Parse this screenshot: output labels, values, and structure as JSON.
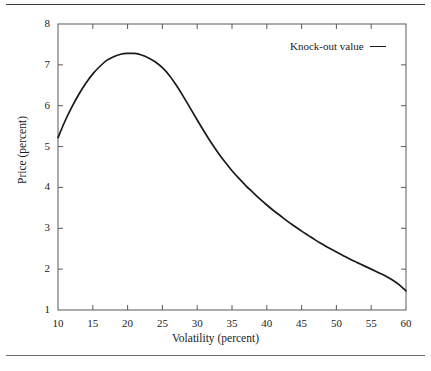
{
  "figure": {
    "top_rule": "horizontal-rule",
    "bottom_rule": "horizontal-rule"
  },
  "chart_data": {
    "type": "line",
    "title": "",
    "xlabel": "Volatility (percent)",
    "ylabel": "Price (percent)",
    "xlim": [
      10,
      60
    ],
    "ylim": [
      1,
      8
    ],
    "xticks": [
      10,
      15,
      20,
      25,
      30,
      35,
      40,
      45,
      50,
      55,
      60
    ],
    "yticks": [
      1,
      2,
      3,
      4,
      5,
      6,
      7,
      8
    ],
    "grid": false,
    "legend_position": "top-right",
    "line_color": "#1a1a1a",
    "series": [
      {
        "name": "Knock-out value",
        "x": [
          10,
          11,
          12,
          13,
          14,
          15,
          16,
          17,
          18,
          19,
          20,
          21,
          22,
          23,
          24,
          25,
          26,
          27,
          28,
          29,
          30,
          31,
          32,
          33,
          34,
          35,
          36,
          37,
          38,
          39,
          40,
          41,
          42,
          43,
          44,
          45,
          46,
          47,
          48,
          49,
          50,
          51,
          52,
          53,
          54,
          55,
          56,
          57,
          58,
          59,
          60
        ],
        "y": [
          5.22,
          5.62,
          5.97,
          6.28,
          6.55,
          6.78,
          6.96,
          7.11,
          7.2,
          7.26,
          7.28,
          7.28,
          7.24,
          7.17,
          7.07,
          6.93,
          6.74,
          6.5,
          6.23,
          5.94,
          5.65,
          5.37,
          5.1,
          4.85,
          4.62,
          4.41,
          4.22,
          4.04,
          3.88,
          3.72,
          3.57,
          3.43,
          3.3,
          3.17,
          3.05,
          2.93,
          2.82,
          2.71,
          2.61,
          2.51,
          2.42,
          2.33,
          2.24,
          2.16,
          2.08,
          2.0,
          1.92,
          1.84,
          1.74,
          1.62,
          1.47
        ]
      }
    ]
  },
  "legend": {
    "entries": [
      {
        "label": "Knock-out value"
      }
    ]
  }
}
